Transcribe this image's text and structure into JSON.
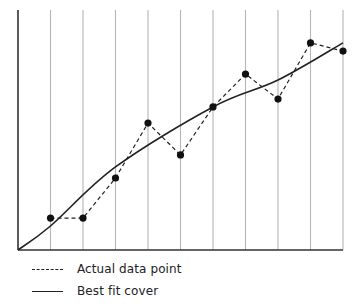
{
  "chart_data": {
    "type": "line",
    "title": "",
    "xlabel": "",
    "ylabel": "",
    "x": [
      1,
      2,
      3,
      4,
      5,
      6,
      7,
      8,
      9,
      10
    ],
    "xlim": [
      0,
      10
    ],
    "ylim": [
      0,
      100
    ],
    "grid": "vertical lines at each x",
    "series": [
      {
        "name": "Actual data point",
        "style": "dashed with markers",
        "values": [
          13.3,
          13.3,
          30.0,
          52.9,
          39.6,
          59.6,
          73.3,
          62.9,
          86.3,
          82.9
        ]
      },
      {
        "name": "Best fit cover",
        "style": "solid curve",
        "x": [
          0,
          1,
          3,
          6,
          8,
          10
        ],
        "values": [
          0,
          10.0,
          34.6,
          59.6,
          70.8,
          86.3
        ]
      }
    ],
    "legend": {
      "position": "bottom-left",
      "entries": [
        "Actual data point",
        "Best fit cover"
      ]
    }
  },
  "legend": {
    "actual_label": "Actual data point",
    "fit_label": "Best fit cover"
  },
  "colors": {
    "line": "#222222",
    "grid": "#b5b5b5",
    "axis": "#333333"
  }
}
